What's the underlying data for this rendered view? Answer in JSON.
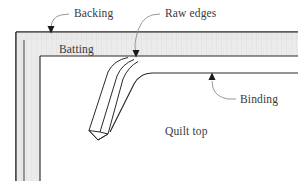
{
  "figure": {
    "background_color": "#ffffff",
    "line_color": "#2a2a2a",
    "leader_color": "#8d8d8d",
    "text_color": "#3a3a3a",
    "batting_fill": "#e8e8e8",
    "backing_fill": "#efefef"
  },
  "labels": {
    "backing": "Backing",
    "raw_edges": "Raw edges",
    "batting": "Batting",
    "binding": "Binding",
    "quilt_top": "Quilt top"
  },
  "callouts": [
    {
      "name": "backing",
      "label": "Backing",
      "text_x": 74,
      "text_y": 16,
      "arrow_x": 51,
      "arrow_y": 33
    },
    {
      "name": "raw-edges",
      "label": "Raw edges",
      "text_x": 165,
      "text_y": 16,
      "arrow_x": 136,
      "arrow_y": 57
    },
    {
      "name": "binding",
      "label": "Binding",
      "text_x": 240,
      "text_y": 101,
      "arrow_x": 212,
      "arrow_y": 73
    }
  ],
  "inline_labels": [
    {
      "name": "batting",
      "label": "Batting",
      "x": 59,
      "y": 52
    },
    {
      "name": "quilt-top",
      "label": "Quilt top",
      "x": 165,
      "y": 134
    }
  ]
}
